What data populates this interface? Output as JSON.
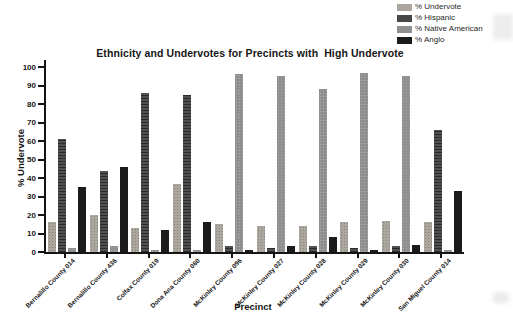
{
  "title": "Ethnicity and Undervotes for Precincts with  High Undervote",
  "chart_data": {
    "type": "bar",
    "title": "Ethnicity and Undervotes for Precincts with  High Undervote",
    "xlabel": "Precinct",
    "ylabel": "% Undervote",
    "ylim": [
      0,
      100
    ],
    "yticks": [
      0,
      10,
      20,
      30,
      40,
      50,
      60,
      70,
      80,
      90,
      100
    ],
    "grid": false,
    "legend_position": "top-right",
    "categories": [
      "Bernalillo County 014",
      "Bernalillo County 436",
      "Colfax County 019",
      "Dona Ana County 060",
      "McKinley County 096",
      "McKinley County 027",
      "McKinley County 028",
      "McKinley County 029",
      "McKinley County 030",
      "San Miguel County 014"
    ],
    "series": [
      {
        "name": "% Undervote",
        "color": "#aba69e",
        "values": [
          16,
          20,
          13,
          37,
          15,
          14,
          14,
          16,
          17,
          16
        ]
      },
      {
        "name": "% Hispanic",
        "color": "#474747",
        "values": [
          61,
          44,
          86,
          85,
          3,
          2,
          3,
          2,
          3,
          66
        ]
      },
      {
        "name": "% Native American",
        "color": "#8f8f8f",
        "values": [
          2,
          3,
          1,
          1,
          96,
          95,
          88,
          97,
          95,
          1
        ]
      },
      {
        "name": "% Anglo",
        "color": "#1b1b1b",
        "values": [
          35,
          46,
          12,
          16,
          1,
          3,
          8,
          1,
          4,
          33
        ]
      }
    ]
  }
}
